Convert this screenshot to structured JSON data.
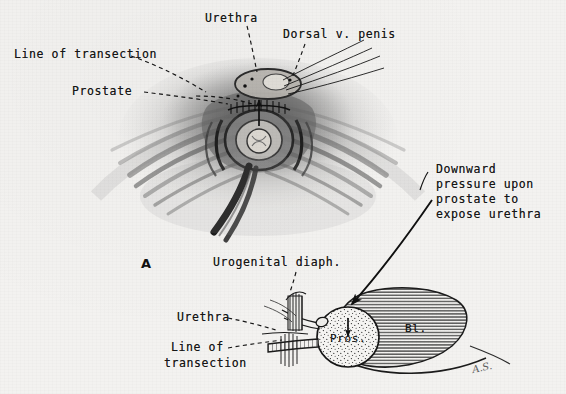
{
  "plate": {
    "background_color": "#f3f2f0",
    "ink_color": "#161616",
    "width": 566,
    "height": 394
  },
  "figure_a": {
    "letter": "A",
    "labels": {
      "urethra": "Urethra",
      "dorsal_vein": "Dorsal v. penis",
      "line_of_transection": "Line of transection",
      "prostate": "Prostate"
    }
  },
  "figure_b": {
    "labels": {
      "urogenital_diaphragm": "Urogenital diaph.",
      "urethra": "Urethra",
      "line_of_transection_1": "Line of",
      "line_of_transection_2": "transection",
      "prostate_abbrev": "Pros.",
      "bladder_abbrev": "Bl."
    },
    "annotation": {
      "line1": "Downward",
      "line2": "pressure upon",
      "line3": "prostate to",
      "line4": "expose urethra"
    }
  },
  "signature": "A.S."
}
